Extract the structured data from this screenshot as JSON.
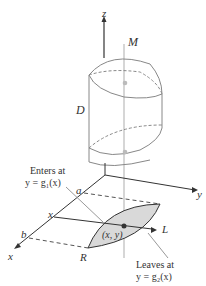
{
  "labels": {
    "z": "z",
    "M": "M",
    "D": "D",
    "y_axis": "y",
    "x_axis": "x",
    "a": "a",
    "b": "b",
    "x_tick": "x",
    "point": "(x, y)",
    "L": "L",
    "R": "R",
    "enters_line1": "Enters at",
    "enters_line2": "y = g₁(x)",
    "leaves_line1": "Leaves at",
    "leaves_line2": "y = g₂(x)"
  },
  "colors": {
    "region_fill": "#d9d9d9",
    "line": "#333333",
    "light_line": "#999999"
  }
}
